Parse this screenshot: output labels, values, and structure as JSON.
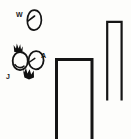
{
  "figure": {
    "background_color": "#fdfdfb",
    "ink_color": "#111111",
    "width": 131,
    "height": 139
  },
  "labels": [
    {
      "id": "w",
      "text": "W",
      "x": 16,
      "y": 11
    },
    {
      "id": "a",
      "text": "A",
      "x": 41,
      "y": 52
    },
    {
      "id": "j",
      "text": "J",
      "x": 6,
      "y": 73
    }
  ],
  "shapes": {
    "top_oval": {
      "name": "oval-with-slash",
      "cx": 34,
      "cy": 20,
      "rx": 7,
      "ry": 10
    },
    "left_oval": {
      "name": "oval-left",
      "cx": 20,
      "cy": 61,
      "rx": 7.5,
      "ry": 9
    },
    "right_oval": {
      "name": "oval-right",
      "cx": 36,
      "cy": 60,
      "rx": 7.5,
      "ry": 9
    },
    "spark_top": {
      "name": "zigzag-spark-top",
      "x": 14,
      "y": 44
    },
    "spark_bottom": {
      "name": "zigzag-spark-bottom",
      "x": 22,
      "y": 68
    },
    "wide_bracket": {
      "name": "wide-inverted-u-bracket",
      "left": 55,
      "right": 93,
      "top": 59,
      "bottom": 139,
      "stroke": 3
    },
    "narrow_bracket": {
      "name": "narrow-inverted-u-bracket",
      "left": 106,
      "right": 123,
      "top": 21,
      "bottom": 100,
      "stroke": 2
    }
  }
}
